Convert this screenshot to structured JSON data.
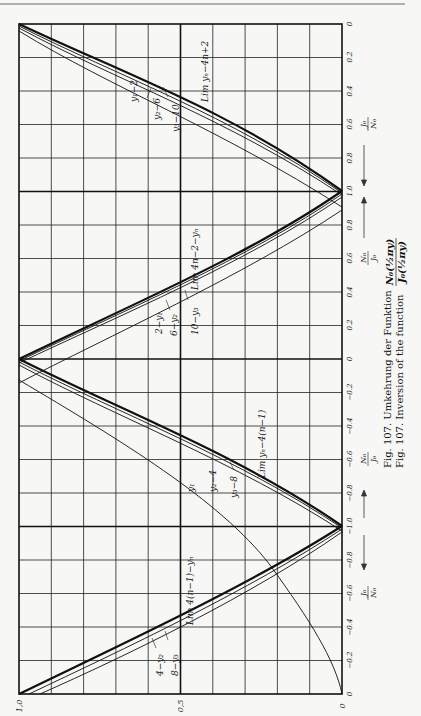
{
  "figure": {
    "caption_de_prefix": "Fig. 107. Umkehrung der Funktion",
    "caption_en_prefix": "Fig. 107. Inversion of the function",
    "caption_fraction_num": "N₀(½πy)",
    "caption_fraction_den": "J₀(½πy)",
    "axis_label_top_num": "J₀",
    "axis_label_top_den": "N₀",
    "axis_label_mid_num": "N₀",
    "axis_label_mid_den": "J₀",
    "axis_label_mid2_num": "N₀",
    "axis_label_mid2_den": "J₀",
    "axis_label_bottom_num": "J₀",
    "axis_label_bottom_den": "N₀"
  },
  "chart_data": {
    "type": "line",
    "orientation": "rotated 90° (page printed sideways)",
    "value_axis": {
      "label": "y",
      "ticks": [
        "1,0",
        "0,5",
        "0"
      ],
      "range": [
        0,
        1.0
      ]
    },
    "argument_axis": {
      "segments": [
        {
          "label": "J₀/N₀",
          "ticks": [
            "0",
            "0.2",
            "0.4",
            "0.6",
            "0.8",
            "1.0"
          ]
        },
        {
          "label": "N₀/J₀",
          "ticks": [
            "1.0",
            "0.8",
            "0.6",
            "0.4",
            "0.2",
            "0"
          ]
        },
        {
          "label": "N₀/J₀",
          "ticks": [
            "0",
            "-0.2",
            "-0.4",
            "-0.6",
            "-0.8",
            "-1.0"
          ]
        },
        {
          "label": "J₀/N₀",
          "ticks": [
            "-1.0",
            "-0.8",
            "-0.6",
            "-0.4",
            "-0.2",
            "0"
          ]
        }
      ]
    },
    "grid": true,
    "series": [
      {
        "name": "y₁",
        "note": "single branch, from N₀/J₀≈-0.12 at y=0 to J₀/N₀→0 at y=1"
      },
      {
        "name": "y₁-2 / 2-y₁",
        "note": "near lim curves"
      },
      {
        "name": "y₂-4 / 4-y₂",
        "note": ""
      },
      {
        "name": "y₂-6 / 6-y₂",
        "note": ""
      },
      {
        "name": "y₃-8 / 8-y₃",
        "note": ""
      },
      {
        "name": "y₃-10 / 10-y₃",
        "note": ""
      },
      {
        "name": "lim yₙ-4n+2",
        "note": "limit curve, segment J₀/N₀ 0→1"
      },
      {
        "name": "lim 4n-2-yₙ",
        "note": "limit curve, segment N₀/J₀ 1→0"
      },
      {
        "name": "lim yₙ-4(n-1)",
        "note": "limit curve, segment N₀/J₀ 0→-1"
      },
      {
        "name": "lim 4(n-1)-yₙ",
        "note": "limit curve, segment J₀/N₀ -1→0"
      }
    ],
    "labels": [
      "y₁-2",
      "y₂-6",
      "y₃-10",
      "lim yₙ-4n+2",
      "lim 4n-2-yₙ",
      "2-y₁",
      "6-y₂",
      "10-y₃",
      "y₁",
      "y₂-4",
      "y₃-8",
      "lim yₙ-4(n-1)",
      "lim 4(n-1)-yₙ",
      "4-y₂",
      "8-y₃"
    ]
  },
  "ticks_right": [
    {
      "y": 24,
      "t": "0"
    },
    {
      "y": 57,
      "t": "0.2"
    },
    {
      "y": 91,
      "t": "0.4"
    },
    {
      "y": 124,
      "t": "0.6"
    },
    {
      "y": 158,
      "t": "0.8"
    },
    {
      "y": 191,
      "t": "1.0"
    },
    {
      "y": 225,
      "t": "0.8"
    },
    {
      "y": 258,
      "t": "0.6"
    },
    {
      "y": 292,
      "t": "0.4"
    },
    {
      "y": 325,
      "t": "0.2"
    },
    {
      "y": 359,
      "t": "0"
    },
    {
      "y": 392,
      "t": "−0.2"
    },
    {
      "y": 426,
      "t": "−0.4"
    },
    {
      "y": 459,
      "t": "−0.6"
    },
    {
      "y": 493,
      "t": "−0.8"
    },
    {
      "y": 526,
      "t": "−1.0"
    },
    {
      "y": 560,
      "t": "−0.8"
    },
    {
      "y": 593,
      "t": "−0.6"
    },
    {
      "y": 627,
      "t": "−0.4"
    },
    {
      "y": 660,
      "t": "−0.2"
    },
    {
      "y": 694,
      "t": "0"
    }
  ],
  "ticks_bottom": [
    {
      "x": 19,
      "t": "1,0"
    },
    {
      "x": 180,
      "t": "0,5"
    },
    {
      "x": 342,
      "t": "0"
    }
  ],
  "curve_labels": {
    "a1": "y₁−2",
    "a2": "y₂−6",
    "a3": "y₃−10",
    "a4": "Lim yₙ−4n+2",
    "b1": "Lim 4n−2−yₙ",
    "b2": "2−y₁",
    "b3": "6−y₂",
    "b4": "10−y₃",
    "c1": "y₁",
    "c2": "y₂−4",
    "c3": "y₃−8",
    "c4": "Lim yₙ−4(n−1)",
    "d1": "Lim 4(n−1)−yₙ",
    "d2": "4−y₂",
    "d3": "8−y₃"
  }
}
